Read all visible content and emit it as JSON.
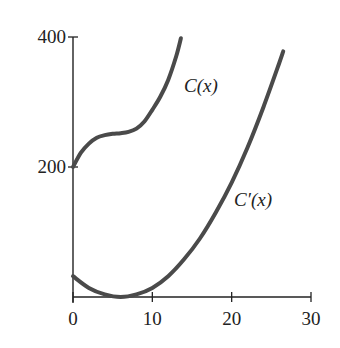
{
  "chart_data": {
    "type": "line",
    "title": "",
    "xlabel": "",
    "ylabel": "",
    "xlim": [
      0,
      30
    ],
    "ylim": [
      0,
      400
    ],
    "x_ticks": [
      0,
      10,
      20,
      30
    ],
    "y_ticks": [
      200,
      400
    ],
    "x_tick_labels": [
      "0",
      "10",
      "20",
      "30"
    ],
    "y_tick_labels": [
      "200",
      "400"
    ],
    "grid": false,
    "legend": "none (curves labeled inline)",
    "series": [
      {
        "name": "C(x)",
        "label": "C(x)",
        "x": [
          0,
          1,
          2,
          3,
          4,
          5,
          6,
          7,
          8,
          9,
          10,
          11,
          12,
          13,
          13.6
        ],
        "y": [
          200,
          222,
          236,
          245,
          249,
          251,
          252,
          254,
          259,
          270,
          288,
          308,
          334,
          370,
          398
        ]
      },
      {
        "name": "C'(x)",
        "label": "C′(x)",
        "x": [
          0,
          2,
          4,
          6,
          8,
          10,
          12,
          14,
          16,
          18,
          20,
          22,
          24,
          26,
          26.5
        ],
        "y": [
          32,
          14,
          4,
          0,
          4,
          14,
          32,
          58,
          90,
          130,
          176,
          230,
          292,
          360,
          378
        ]
      }
    ],
    "annotations": [
      {
        "text": "C(x)",
        "near_series": "C(x)",
        "x": 13.5,
        "y": 325
      },
      {
        "text": "C′(x)",
        "near_series": "C'(x)",
        "x": 19.8,
        "y": 150
      }
    ]
  }
}
